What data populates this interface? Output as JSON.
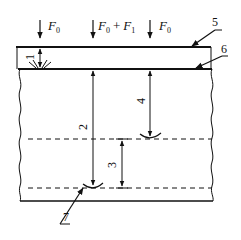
{
  "forces": [
    {
      "label": "F",
      "sub": "0",
      "extra": ""
    },
    {
      "label": "F",
      "sub": "0",
      "extra": " + F",
      "extra_sub": "1"
    },
    {
      "label": "F",
      "sub": "0",
      "extra": ""
    }
  ],
  "force_labels": {
    "left_main": "F",
    "left_sub": "0",
    "mid_main1": "F",
    "mid_sub1": "0",
    "mid_plus": "+",
    "mid_main2": "F",
    "mid_sub2": "1",
    "right_main": "F",
    "right_sub": "0"
  },
  "dimension_labels": {
    "d1": "1",
    "d2": "2",
    "d3": "3",
    "d4": "4"
  },
  "leader_labels": {
    "l5": "5",
    "l6": "6",
    "l7": "7"
  },
  "colors": {
    "stroke": "#111111",
    "background": "#ffffff"
  }
}
